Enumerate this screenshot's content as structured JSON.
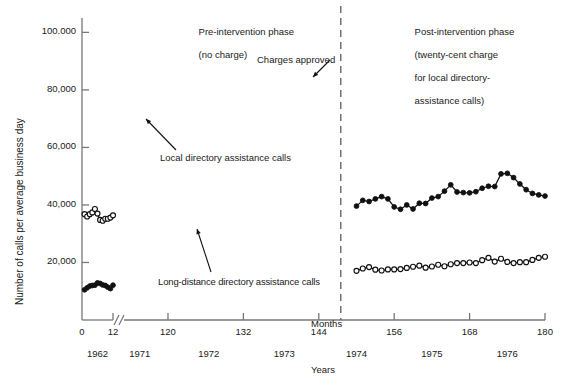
{
  "axes": {
    "ylabel": "Number of calls per average business day",
    "xlabel_months": "Months",
    "xlabel_years": "Years",
    "y_ticks": [
      "100.000",
      "80,000",
      "60,000",
      "40,000",
      "20,000"
    ],
    "y_tick_values": [
      100000,
      80000,
      60000,
      40000,
      20000
    ],
    "x_ticks": [
      "0",
      "12",
      "120",
      "132",
      "144",
      "156",
      "168",
      "180"
    ],
    "x_tick_values": [
      0,
      12,
      120,
      132,
      144,
      156,
      168,
      180
    ],
    "year_labels": [
      "1962",
      "1971",
      "1972",
      "1973",
      "1974",
      "1975",
      "1976"
    ],
    "year_label_months": [
      6,
      115.5,
      126.5,
      138.5,
      150,
      162,
      174
    ],
    "axis_break_after": 12,
    "grid": false
  },
  "annotations": {
    "phase_pre_line1": "Pre-intervention phase",
    "phase_pre_line2": "(no charge)",
    "phase_post_line1": "Post-intervention phase",
    "phase_post_line2": "(twenty-cent charge",
    "phase_post_line3": "for local directory-",
    "phase_post_line4": "assistance calls)",
    "charges_approved": "Charges approved",
    "local_label": "Local directory assistance calls",
    "longdistance_label": "Long-distance directory assistance calls",
    "intervention_divider_month": 147.5
  },
  "colors": {
    "axis": "#777777",
    "line": "#111111",
    "marker_open_fill": "#ffffff",
    "marker_closed_fill": "#111111",
    "text": "#1a1a1a",
    "divider": "#666666"
  },
  "chart_data": {
    "type": "line",
    "title": "",
    "xlabel": "Months",
    "ylabel": "Number of calls per average business day",
    "xlim": [
      0,
      180
    ],
    "ylim": [
      0,
      105000
    ],
    "legend": "none",
    "series": [
      {
        "name": "Local directory assistance calls",
        "marker": "open-circle",
        "segments": [
          {
            "phase": "pre-1962",
            "x": [
              1,
              2,
              3,
              4,
              5,
              6,
              7,
              8,
              9,
              10,
              11,
              12
            ],
            "y": [
              36800,
              36000,
              36800,
              37400,
              38600,
              37000,
              34800,
              34500,
              35200,
              35200,
              35600,
              36400
            ]
          },
          {
            "phase": "pre-intervention",
            "x": [
              13,
              14,
              15,
              16,
              17,
              18,
              19,
              20,
              21,
              22,
              23,
              24,
              25,
              26,
              27,
              28,
              29,
              30,
              31,
              32,
              33,
              34,
              35,
              36,
              37,
              38,
              39,
              40,
              41,
              42,
              43,
              44,
              45,
              46,
              47,
              48,
              49,
              50,
              51,
              52,
              53,
              54,
              55,
              56,
              57,
              58,
              59,
              60,
              61,
              62,
              63,
              64,
              65
            ],
            "y": [
              40200,
              66500,
              68200,
              70400,
              70200,
              71100,
              71300,
              71100,
              72000,
              65200,
              64300,
              67000,
              68400,
              69500,
              70500,
              71200,
              75800,
              70300,
              69300,
              70800,
              72300,
              73500,
              74300,
              73800,
              73600,
              73300,
              72500,
              71100,
              74500,
              78200,
              77400,
              81200,
              83800,
              85900,
              80000,
              78500,
              74200,
              65000,
              62300,
              61600,
              62500,
              69400,
              65500,
              55500
            ]
          }
        ],
        "post_x": [
          150,
          151,
          152,
          153,
          154,
          155,
          156,
          157,
          158,
          159,
          160,
          161,
          162,
          163,
          164,
          165,
          166,
          167,
          168,
          169,
          170,
          171,
          172,
          173,
          174,
          175,
          176,
          177,
          178,
          179,
          180
        ],
        "post_y": [
          17100,
          17900,
          18400,
          17500,
          17200,
          17600,
          17600,
          17700,
          18100,
          18500,
          18900,
          18200,
          18600,
          19200,
          18700,
          19400,
          19800,
          19800,
          20000,
          19800,
          20800,
          21600,
          20300,
          21300,
          20200,
          19800,
          20100,
          20100,
          20900,
          21600,
          22000
        ]
      },
      {
        "name": "Long-distance directory assistance calls",
        "marker": "closed-circle",
        "segments": [
          {
            "phase": "pre-1962",
            "x": [
              1,
              2,
              3,
              4,
              5,
              6,
              7,
              8,
              9,
              10,
              11,
              12
            ],
            "y": [
              10500,
              11200,
              11800,
              12000,
              12100,
              12900,
              12700,
              12200,
              12000,
              11400,
              10900,
              12100
            ]
          },
          {
            "phase": "pre-intervention",
            "x": [
              13,
              14,
              15,
              16,
              17,
              18,
              19,
              20,
              21,
              22,
              23,
              24,
              25,
              26,
              27,
              28,
              29,
              30,
              31,
              32,
              33,
              34,
              35,
              36,
              37,
              38,
              39,
              40,
              41,
              42,
              43,
              44,
              45,
              46,
              47,
              48,
              49,
              50,
              51,
              52,
              53,
              54,
              55
            ],
            "y": [
              30100,
              29200,
              30300,
              30600,
              31100,
              31700,
              32300,
              32500,
              32900,
              33200,
              32200,
              32700,
              31500,
              30900,
              30500,
              32400,
              33100,
              33600,
              34000,
              35200,
              34500,
              35800,
              37000,
              36400,
              36900,
              37900,
              36700,
              37600,
              38500,
              37200,
              36600,
              36200,
              37200,
              38000,
              39600
            ]
          }
        ],
        "post_x": [
          150,
          151,
          152,
          153,
          154,
          155,
          156,
          157,
          158,
          159,
          160,
          161,
          162,
          163,
          164,
          165,
          166,
          167,
          168,
          169,
          170,
          171,
          172,
          173,
          174,
          175,
          176,
          177,
          178,
          179,
          180
        ],
        "post_y": [
          39600,
          41600,
          41200,
          42100,
          42900,
          42100,
          39300,
          38500,
          40000,
          38600,
          40600,
          40500,
          42400,
          42900,
          44800,
          47000,
          44500,
          44300,
          44200,
          44600,
          45800,
          46500,
          46400,
          50800,
          51000,
          49500,
          47300,
          45300,
          44000,
          43500,
          43100
        ]
      }
    ]
  }
}
